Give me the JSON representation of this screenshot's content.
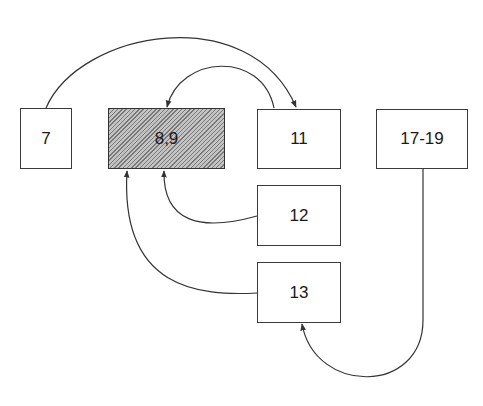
{
  "diagram": {
    "type": "flow",
    "nodes": [
      {
        "id": "n7",
        "label": "7",
        "shaded": false
      },
      {
        "id": "n89",
        "label": "8,9",
        "shaded": true
      },
      {
        "id": "n11",
        "label": "11",
        "shaded": false
      },
      {
        "id": "n1719",
        "label": "17-19",
        "shaded": false
      },
      {
        "id": "n12",
        "label": "12",
        "shaded": false
      },
      {
        "id": "n13",
        "label": "13",
        "shaded": false
      }
    ],
    "edges": [
      {
        "from": "7",
        "to": "11"
      },
      {
        "from": "11",
        "to": "8,9"
      },
      {
        "from": "12",
        "to": "8,9"
      },
      {
        "from": "13",
        "to": "8,9"
      },
      {
        "from": "17-19",
        "to": "13"
      }
    ],
    "colors": {
      "line": "#333333",
      "hatch": "#777777",
      "background": "#ffffff"
    }
  }
}
